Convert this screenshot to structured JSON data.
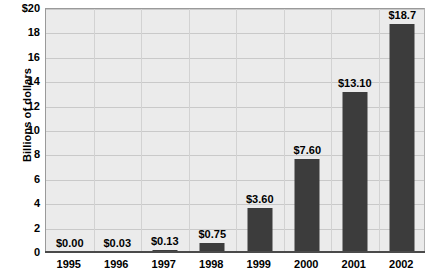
{
  "chart_data": {
    "type": "bar",
    "title": "",
    "xlabel": "",
    "ylabel": "Billions of dollars",
    "categories": [
      "1995",
      "1996",
      "1997",
      "1998",
      "1999",
      "2000",
      "2001",
      "2002"
    ],
    "values": [
      0.0,
      0.03,
      0.13,
      0.75,
      3.6,
      7.6,
      13.1,
      18.7
    ],
    "data_labels": [
      "$0.00",
      "$0.03",
      "$0.13",
      "$0.75",
      "$3.60",
      "$7.60",
      "$13.10",
      "$18.7"
    ],
    "ylim": [
      0,
      20
    ],
    "y_ticks": [
      0,
      2,
      4,
      6,
      8,
      10,
      12,
      14,
      16,
      18,
      20
    ],
    "y_tick_labels": [
      "0",
      "2",
      "4",
      "6",
      "8",
      "10",
      "12",
      "14",
      "16",
      "18",
      "$20"
    ],
    "grid": true,
    "legend": "none",
    "bar_color": "#3c3c3c",
    "plot_background": "#ebebeb",
    "gridline_color": "#c9c9c9"
  }
}
